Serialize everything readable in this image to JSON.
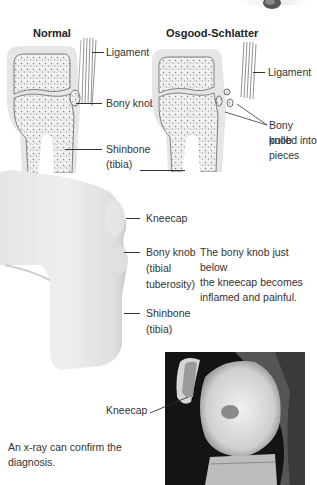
{
  "diagram": {
    "normal": {
      "title": "Normal",
      "labels": {
        "ligament": "Ligament",
        "bony_knob": "Bony knob",
        "shinbone_1": "Shinbone",
        "shinbone_2": "(tibia)"
      }
    },
    "osgood": {
      "title": "Osgood-Schlatter",
      "labels": {
        "ligament": "Ligament",
        "bony_knob_1": "Bony knob",
        "bony_knob_2": "pulled into",
        "bony_knob_3": "pieces"
      }
    },
    "knee": {
      "labels": {
        "kneecap": "Kneecap",
        "bony_knob_1": "Bony knob",
        "bony_knob_2": "(tibial",
        "bony_knob_3": "tuberosity)",
        "shinbone_1": "Shinbone",
        "shinbone_2": "(tibia)"
      },
      "caption": [
        "The bony knob just below",
        "the kneecap becomes",
        "inflamed and painful."
      ]
    },
    "xray": {
      "label": "Kneecap",
      "caption": [
        "An x-ray can confirm the",
        "diagnosis."
      ]
    }
  },
  "colors": {
    "cartilage": "#e6e6e6",
    "bone": "#f4f4f4",
    "text": "#333333",
    "xray_bg": "#151515"
  }
}
